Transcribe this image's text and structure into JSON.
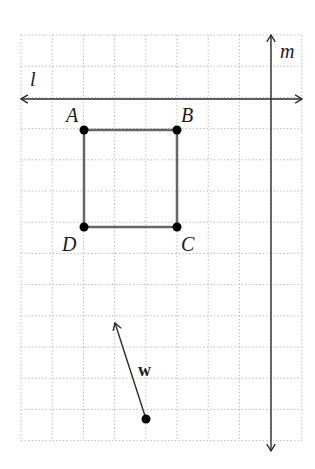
{
  "diagram": {
    "type": "coordinate-grid-transformation",
    "grid": {
      "x0": 21,
      "y0": 35,
      "cols": 9,
      "rows": 13,
      "cell": 31.2,
      "line_color": "#bdbdbd"
    },
    "lines": [
      {
        "id": "l",
        "label": "l",
        "orientation": "horizontal",
        "y": 99,
        "x1": 21,
        "x2": 302,
        "label_x": 30,
        "label_y": 86
      },
      {
        "id": "m",
        "label": "m",
        "orientation": "vertical",
        "x": 271,
        "y1": 35,
        "y2": 451,
        "label_x": 280,
        "label_y": 58
      }
    ],
    "square": {
      "stroke": "#666666",
      "vertices": [
        {
          "name": "A",
          "label": "A",
          "x": 84,
          "y": 130,
          "label_x": 66,
          "label_y": 122
        },
        {
          "name": "B",
          "label": "B",
          "x": 177,
          "y": 130,
          "label_x": 181,
          "label_y": 122
        },
        {
          "name": "C",
          "label": "C",
          "x": 177,
          "y": 227,
          "label_x": 181,
          "label_y": 251
        },
        {
          "name": "D",
          "label": "D",
          "x": 84,
          "y": 227,
          "label_x": 62,
          "label_y": 251
        }
      ]
    },
    "vector": {
      "label": "w",
      "tail": {
        "x": 146,
        "y": 419
      },
      "head": {
        "x": 115,
        "y": 323
      },
      "label_x": 138,
      "label_y": 376
    },
    "ink_color": "#2b2b2b"
  }
}
